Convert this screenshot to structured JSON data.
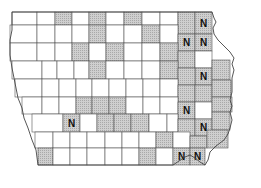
{
  "map": {
    "title": "Iowa counties",
    "legend_marker": "N",
    "colors": {
      "shaded": "#c8c8c8",
      "plain": "#ffffff",
      "border": "#555555",
      "label": "#111111"
    },
    "counties": [
      {
        "x": 12,
        "y": 12,
        "w": 25,
        "h": 13,
        "shaded": false
      },
      {
        "x": 37,
        "y": 12,
        "w": 18,
        "h": 13,
        "shaded": false
      },
      {
        "x": 55,
        "y": 12,
        "w": 17,
        "h": 13,
        "shaded": true
      },
      {
        "x": 72,
        "y": 12,
        "w": 17,
        "h": 13,
        "shaded": false
      },
      {
        "x": 89,
        "y": 12,
        "w": 17,
        "h": 13,
        "shaded": true
      },
      {
        "x": 106,
        "y": 12,
        "w": 18,
        "h": 13,
        "shaded": false
      },
      {
        "x": 124,
        "y": 12,
        "w": 18,
        "h": 13,
        "shaded": true
      },
      {
        "x": 142,
        "y": 12,
        "w": 18,
        "h": 13,
        "shaded": false
      },
      {
        "x": 160,
        "y": 12,
        "w": 18,
        "h": 13,
        "shaded": false
      },
      {
        "x": 178,
        "y": 12,
        "w": 17,
        "h": 22,
        "shaded": true
      },
      {
        "x": 195,
        "y": 12,
        "w": 17,
        "h": 22,
        "shaded": true,
        "label": "N"
      },
      {
        "x": 10,
        "y": 25,
        "w": 27,
        "h": 18,
        "shaded": false
      },
      {
        "x": 37,
        "y": 25,
        "w": 18,
        "h": 18,
        "shaded": false
      },
      {
        "x": 55,
        "y": 25,
        "w": 17,
        "h": 18,
        "shaded": false
      },
      {
        "x": 72,
        "y": 25,
        "w": 17,
        "h": 18,
        "shaded": false
      },
      {
        "x": 89,
        "y": 25,
        "w": 17,
        "h": 18,
        "shaded": true
      },
      {
        "x": 106,
        "y": 25,
        "w": 18,
        "h": 18,
        "shaded": false
      },
      {
        "x": 124,
        "y": 25,
        "w": 18,
        "h": 18,
        "shaded": false
      },
      {
        "x": 142,
        "y": 25,
        "w": 18,
        "h": 18,
        "shaded": true
      },
      {
        "x": 160,
        "y": 25,
        "w": 18,
        "h": 18,
        "shaded": false
      },
      {
        "x": 178,
        "y": 34,
        "w": 17,
        "h": 17,
        "shaded": true,
        "label": "N"
      },
      {
        "x": 195,
        "y": 34,
        "w": 17,
        "h": 17,
        "shaded": true,
        "label": "N"
      },
      {
        "x": 10,
        "y": 43,
        "w": 27,
        "h": 18,
        "shaded": false
      },
      {
        "x": 37,
        "y": 43,
        "w": 18,
        "h": 18,
        "shaded": false
      },
      {
        "x": 55,
        "y": 43,
        "w": 17,
        "h": 18,
        "shaded": false
      },
      {
        "x": 72,
        "y": 43,
        "w": 17,
        "h": 18,
        "shaded": true
      },
      {
        "x": 89,
        "y": 43,
        "w": 17,
        "h": 18,
        "shaded": false
      },
      {
        "x": 106,
        "y": 43,
        "w": 18,
        "h": 18,
        "shaded": true
      },
      {
        "x": 124,
        "y": 43,
        "w": 18,
        "h": 18,
        "shaded": false
      },
      {
        "x": 142,
        "y": 43,
        "w": 18,
        "h": 18,
        "shaded": false
      },
      {
        "x": 160,
        "y": 43,
        "w": 18,
        "h": 18,
        "shaded": true
      },
      {
        "x": 178,
        "y": 51,
        "w": 17,
        "h": 17,
        "shaded": true
      },
      {
        "x": 195,
        "y": 51,
        "w": 17,
        "h": 17,
        "shaded": false
      },
      {
        "x": 12,
        "y": 61,
        "w": 30,
        "h": 18,
        "shaded": false
      },
      {
        "x": 42,
        "y": 61,
        "w": 15,
        "h": 18,
        "shaded": false
      },
      {
        "x": 57,
        "y": 61,
        "w": 17,
        "h": 18,
        "shaded": false
      },
      {
        "x": 74,
        "y": 61,
        "w": 15,
        "h": 18,
        "shaded": false
      },
      {
        "x": 89,
        "y": 61,
        "w": 17,
        "h": 18,
        "shaded": true
      },
      {
        "x": 106,
        "y": 61,
        "w": 18,
        "h": 18,
        "shaded": false
      },
      {
        "x": 124,
        "y": 61,
        "w": 18,
        "h": 18,
        "shaded": false
      },
      {
        "x": 142,
        "y": 61,
        "w": 18,
        "h": 18,
        "shaded": false
      },
      {
        "x": 160,
        "y": 61,
        "w": 18,
        "h": 18,
        "shaded": true
      },
      {
        "x": 195,
        "y": 68,
        "w": 17,
        "h": 17,
        "shaded": true,
        "label": "N"
      },
      {
        "x": 212,
        "y": 60,
        "w": 18,
        "h": 20,
        "shaded": true
      },
      {
        "x": 178,
        "y": 68,
        "w": 17,
        "h": 17,
        "shaded": true
      },
      {
        "x": 15,
        "y": 79,
        "w": 27,
        "h": 18,
        "shaded": false
      },
      {
        "x": 42,
        "y": 79,
        "w": 17,
        "h": 18,
        "shaded": false
      },
      {
        "x": 59,
        "y": 79,
        "w": 17,
        "h": 18,
        "shaded": false
      },
      {
        "x": 76,
        "y": 79,
        "w": 16,
        "h": 18,
        "shaded": false
      },
      {
        "x": 92,
        "y": 79,
        "w": 17,
        "h": 18,
        "shaded": false
      },
      {
        "x": 109,
        "y": 79,
        "w": 17,
        "h": 18,
        "shaded": false
      },
      {
        "x": 126,
        "y": 79,
        "w": 17,
        "h": 18,
        "shaded": false
      },
      {
        "x": 143,
        "y": 79,
        "w": 17,
        "h": 18,
        "shaded": false
      },
      {
        "x": 160,
        "y": 79,
        "w": 18,
        "h": 18,
        "shaded": false
      },
      {
        "x": 178,
        "y": 85,
        "w": 17,
        "h": 17,
        "shaded": true
      },
      {
        "x": 195,
        "y": 85,
        "w": 17,
        "h": 17,
        "shaded": true
      },
      {
        "x": 212,
        "y": 80,
        "w": 19,
        "h": 17,
        "shaded": true
      },
      {
        "x": 22,
        "y": 97,
        "w": 20,
        "h": 17,
        "shaded": false
      },
      {
        "x": 42,
        "y": 97,
        "w": 17,
        "h": 17,
        "shaded": false
      },
      {
        "x": 59,
        "y": 97,
        "w": 17,
        "h": 17,
        "shaded": false
      },
      {
        "x": 76,
        "y": 97,
        "w": 16,
        "h": 17,
        "shaded": true
      },
      {
        "x": 92,
        "y": 97,
        "w": 17,
        "h": 17,
        "shaded": true
      },
      {
        "x": 109,
        "y": 97,
        "w": 17,
        "h": 17,
        "shaded": true
      },
      {
        "x": 126,
        "y": 97,
        "w": 17,
        "h": 17,
        "shaded": false
      },
      {
        "x": 143,
        "y": 97,
        "w": 17,
        "h": 17,
        "shaded": false
      },
      {
        "x": 160,
        "y": 97,
        "w": 18,
        "h": 17,
        "shaded": false
      },
      {
        "x": 178,
        "y": 102,
        "w": 17,
        "h": 17,
        "shaded": true,
        "label": "N"
      },
      {
        "x": 195,
        "y": 102,
        "w": 17,
        "h": 17,
        "shaded": false
      },
      {
        "x": 212,
        "y": 97,
        "w": 20,
        "h": 15,
        "shaded": true
      },
      {
        "x": 32,
        "y": 114,
        "w": 31,
        "h": 18,
        "shaded": false
      },
      {
        "x": 63,
        "y": 114,
        "w": 17,
        "h": 18,
        "shaded": true,
        "label": "N"
      },
      {
        "x": 80,
        "y": 114,
        "w": 17,
        "h": 18,
        "shaded": false
      },
      {
        "x": 97,
        "y": 114,
        "w": 17,
        "h": 18,
        "shaded": true
      },
      {
        "x": 114,
        "y": 114,
        "w": 17,
        "h": 18,
        "shaded": true
      },
      {
        "x": 131,
        "y": 114,
        "w": 18,
        "h": 18,
        "shaded": true
      },
      {
        "x": 149,
        "y": 114,
        "w": 18,
        "h": 18,
        "shaded": false
      },
      {
        "x": 167,
        "y": 114,
        "w": 11,
        "h": 18,
        "shaded": false
      },
      {
        "x": 178,
        "y": 119,
        "w": 17,
        "h": 17,
        "shaded": true
      },
      {
        "x": 195,
        "y": 119,
        "w": 17,
        "h": 17,
        "shaded": true,
        "label": "N"
      },
      {
        "x": 212,
        "y": 112,
        "w": 18,
        "h": 18,
        "shaded": true
      },
      {
        "x": 35,
        "y": 132,
        "w": 18,
        "h": 16,
        "shaded": false
      },
      {
        "x": 53,
        "y": 132,
        "w": 17,
        "h": 16,
        "shaded": false
      },
      {
        "x": 70,
        "y": 132,
        "w": 17,
        "h": 16,
        "shaded": false
      },
      {
        "x": 87,
        "y": 132,
        "w": 18,
        "h": 16,
        "shaded": false
      },
      {
        "x": 105,
        "y": 132,
        "w": 17,
        "h": 16,
        "shaded": false
      },
      {
        "x": 122,
        "y": 132,
        "w": 17,
        "h": 16,
        "shaded": false
      },
      {
        "x": 139,
        "y": 132,
        "w": 17,
        "h": 16,
        "shaded": false
      },
      {
        "x": 156,
        "y": 132,
        "w": 17,
        "h": 16,
        "shaded": true
      },
      {
        "x": 173,
        "y": 132,
        "w": 17,
        "h": 16,
        "shaded": false
      },
      {
        "x": 190,
        "y": 136,
        "w": 17,
        "h": 12,
        "shaded": true
      },
      {
        "x": 207,
        "y": 130,
        "w": 21,
        "h": 18,
        "shaded": true
      },
      {
        "x": 38,
        "y": 148,
        "w": 15,
        "h": 17,
        "shaded": true
      },
      {
        "x": 53,
        "y": 148,
        "w": 17,
        "h": 17,
        "shaded": false
      },
      {
        "x": 70,
        "y": 148,
        "w": 17,
        "h": 17,
        "shaded": false
      },
      {
        "x": 87,
        "y": 148,
        "w": 18,
        "h": 17,
        "shaded": false
      },
      {
        "x": 105,
        "y": 148,
        "w": 17,
        "h": 17,
        "shaded": false
      },
      {
        "x": 122,
        "y": 148,
        "w": 17,
        "h": 17,
        "shaded": false
      },
      {
        "x": 139,
        "y": 148,
        "w": 17,
        "h": 17,
        "shaded": true
      },
      {
        "x": 156,
        "y": 148,
        "w": 17,
        "h": 17,
        "shaded": false
      },
      {
        "x": 173,
        "y": 148,
        "w": 17,
        "h": 17,
        "shaded": true,
        "label": "N"
      },
      {
        "x": 190,
        "y": 148,
        "w": 15,
        "h": 17,
        "shaded": true,
        "label": "N"
      }
    ]
  }
}
